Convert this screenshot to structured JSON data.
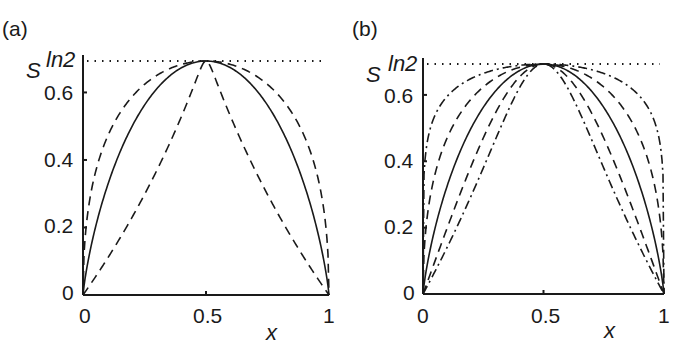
{
  "chart_data": [
    {
      "type": "line",
      "panel_label": "(a)",
      "xlabel": "x",
      "ylabel": "S",
      "xlim": [
        0,
        1
      ],
      "ylim": [
        0,
        0.6931
      ],
      "x_ticks": [
        "0",
        "0.5",
        "1"
      ],
      "y_ticks": [
        "0",
        "0.2",
        "0.4",
        "0.6",
        "ln2"
      ],
      "reference_line": {
        "y": 0.6931,
        "label": "ln2",
        "style": "dotted"
      },
      "grid": false,
      "series": [
        {
          "name": "Shannon entropy",
          "style": "solid",
          "q": 1
        },
        {
          "name": "upper dashed",
          "style": "dashed",
          "q": 0.5
        },
        {
          "name": "lower dashed (triangle)",
          "style": "dashed",
          "q": 30
        }
      ]
    },
    {
      "type": "line",
      "panel_label": "(b)",
      "xlabel": "x",
      "ylabel": "S",
      "xlim": [
        0,
        1
      ],
      "ylim": [
        0,
        0.6931
      ],
      "x_ticks": [
        "0",
        "0.5",
        "1"
      ],
      "y_ticks": [
        "0",
        "0.2",
        "0.4",
        "0.6",
        "ln2"
      ],
      "reference_line": {
        "y": 0.6931,
        "label": "ln2",
        "style": "dotted"
      },
      "grid": false,
      "series": [
        {
          "name": "Shannon entropy",
          "style": "solid",
          "q": 1
        },
        {
          "name": "upper dashed",
          "style": "dashed",
          "q": 0.5
        },
        {
          "name": "upper dash-dot",
          "style": "dashdot",
          "q": 0.2
        },
        {
          "name": "lower dashed",
          "style": "dashed",
          "q": 2
        },
        {
          "name": "lower dash-dot",
          "style": "dashdot",
          "q": 4
        }
      ]
    }
  ],
  "panels": {
    "a": {
      "label": "(a)",
      "ylabel": "S",
      "xlabel": "x",
      "ln2": "ln2",
      "yticks": [
        "0.6",
        "0.4",
        "0.2",
        "0"
      ],
      "xticks": [
        "0",
        "0.5",
        "1"
      ]
    },
    "b": {
      "label": "(b)",
      "ylabel": "S",
      "xlabel": "x",
      "ln2": "ln2",
      "yticks": [
        "0.6",
        "0.4",
        "0.2",
        "0"
      ],
      "xticks": [
        "0",
        "0.5",
        "1"
      ]
    }
  },
  "colors": {
    "ink": "#1a1a1a",
    "background": "#ffffff"
  }
}
